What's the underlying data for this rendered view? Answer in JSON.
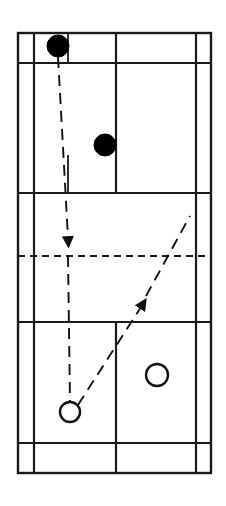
{
  "figure": {
    "name": "badminton-court-diagram",
    "background_color": "#ffffff",
    "line_color": "#1a1a1a",
    "width": 226,
    "height": 506
  },
  "court": {
    "label": "badminton-court",
    "outer_boundary": {
      "x": 18,
      "y": 33,
      "width": 193,
      "height": 440
    },
    "stroke_width": 2.4,
    "vertical_lines": [
      {
        "name": "left-sideline-singles",
        "x": 34,
        "y1": 33,
        "y2": 473,
        "label": "Left singles sideline"
      },
      {
        "name": "center-line-upper",
        "x": 68,
        "y1": 33,
        "y2": 63,
        "label": "Upper centre line stub"
      },
      {
        "name": "center-service-line-top",
        "x": 68,
        "y1": 155,
        "y2": 193,
        "label": "Top centre service line"
      },
      {
        "name": "center-service-line-bottom",
        "x": 116,
        "y1": 322,
        "y2": 473,
        "label": "Bottom centre service line"
      },
      {
        "name": "mid-court-vertical",
        "x": 116,
        "y1": 33,
        "y2": 193,
        "label": "Mid court vertical"
      },
      {
        "name": "right-sideline-singles",
        "x": 196,
        "y1": 33,
        "y2": 473,
        "label": "Right singles sideline"
      }
    ],
    "horizontal_lines": [
      {
        "name": "top-baseline",
        "y": 33,
        "x1": 18,
        "x2": 211,
        "label": "Top back boundary"
      },
      {
        "name": "top-long-service-line",
        "y": 63,
        "x1": 18,
        "x2": 211,
        "label": "Top long service line (doubles)"
      },
      {
        "name": "top-short-service-line",
        "y": 193,
        "x1": 18,
        "x2": 211,
        "label": "Top short service line"
      },
      {
        "name": "bottom-short-service-line",
        "y": 322,
        "x1": 18,
        "x2": 211,
        "label": "Bottom short service line"
      },
      {
        "name": "bottom-long-service-line",
        "y": 443,
        "x1": 18,
        "x2": 211,
        "label": "Bottom long service line (doubles)"
      },
      {
        "name": "bottom-baseline",
        "y": 473,
        "x1": 18,
        "x2": 211,
        "label": "Bottom back boundary"
      }
    ],
    "net_line": {
      "name": "net",
      "y": 256,
      "x1": 18,
      "x2": 211,
      "label": "Net",
      "dash": "7 5",
      "stroke_width": 2
    }
  },
  "players": [
    {
      "name": "player-dark-back",
      "style": "filled",
      "fill": "#000000",
      "cx": 58,
      "cy": 46,
      "r": 11,
      "label": "Dark player at back (server)"
    },
    {
      "name": "player-dark-front",
      "style": "filled",
      "fill": "#000000",
      "cx": 105,
      "cy": 145,
      "r": 11,
      "label": "Dark player in front"
    },
    {
      "name": "player-light-left",
      "style": "open",
      "fill": "#ffffff",
      "cx": 70,
      "cy": 412,
      "r": 10,
      "label": "Light player left (receiver)"
    },
    {
      "name": "player-light-right",
      "style": "open",
      "fill": "#ffffff",
      "cx": 157,
      "cy": 375,
      "r": 11,
      "label": "Light player right"
    }
  ],
  "trajectories": [
    {
      "name": "shuttle-path-downward",
      "label": "Shuttle path hit downward from dark back player across the net",
      "direction": "down",
      "dash": "11 7",
      "stroke_width": 2,
      "points": [
        {
          "x": 58,
          "y": 57
        },
        {
          "x": 68,
          "y": 240
        }
      ],
      "arrow": {
        "tip_x": 68,
        "tip_y": 250,
        "angle_deg": 90
      }
    },
    {
      "name": "shuttle-path-continuation",
      "label": "Shuttle path continuing down to the light player on the left",
      "direction": "down",
      "dash": "11 7",
      "stroke_width": 2,
      "points": [
        {
          "x": 68,
          "y": 256
        },
        {
          "x": 70,
          "y": 402
        }
      ]
    },
    {
      "name": "return-path-upward",
      "label": "Return shot travelling up court from the light player",
      "direction": "up",
      "dash": "11 7",
      "stroke_width": 2,
      "points": [
        {
          "x": 78,
          "y": 405
        },
        {
          "x": 190,
          "y": 216
        }
      ],
      "arrow": {
        "tip_x": 142,
        "tip_y": 304,
        "angle_deg": -59
      }
    }
  ],
  "legend": {
    "filled_circle_meaning": "Serving side player",
    "open_circle_meaning": "Receiving side player",
    "dashed_arrow_meaning": "Shuttle trajectory"
  }
}
